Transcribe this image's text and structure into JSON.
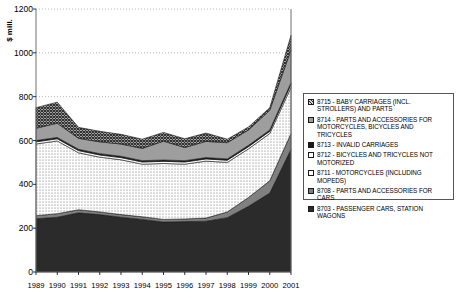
{
  "chart_data": {
    "type": "area",
    "title": "",
    "subtitle": "",
    "xlabel": "",
    "ylabel": "$ mill.",
    "ylim": [
      0,
      1200
    ],
    "yticks": [
      0,
      200,
      400,
      600,
      800,
      1000,
      1200
    ],
    "ytick_labels": [
      "0",
      "200",
      "400",
      "600",
      "800",
      "1000",
      "1200"
    ],
    "grid": "horizontal-dotted",
    "legend_position": "right",
    "stacked": true,
    "categories": [
      "1989",
      "1990",
      "1991",
      "1992",
      "1993",
      "1994",
      "1995",
      "1996",
      "1997",
      "1998",
      "1999",
      "2000",
      "2001"
    ],
    "series": [
      {
        "name": "8703 - PASSENGER CARS, STATION WAGONS",
        "code": "8703",
        "label": "8703 - PASSENGER CARS, STATION WAGONS",
        "pattern": "solid-dark",
        "color": "#2b2b2b",
        "values": [
          243,
          250,
          270,
          262,
          250,
          240,
          228,
          230,
          232,
          248,
          300,
          360,
          560
        ]
      },
      {
        "name": "8708 - PARTS AND ACCESSORIES FOR CARS",
        "code": "8708",
        "label": "8708 - PARTS AND ACCESSORIES FOR CARS",
        "pattern": "solid-gray",
        "color": "#808080",
        "values": [
          14,
          16,
          14,
          12,
          12,
          12,
          12,
          12,
          14,
          26,
          40,
          56,
          72
        ]
      },
      {
        "name": "8711 - MOTORCYCLES (INCLUDING MOPEDS)",
        "code": "8711",
        "label": "8711 - MOTORCYCLES (INCLUDING MOPEDS)",
        "pattern": "fine-dotted",
        "color": "#f2f2f2",
        "values": [
          327,
          332,
          260,
          250,
          250,
          240,
          255,
          250,
          260,
          226,
          222,
          216,
          210
        ]
      },
      {
        "name": "8712 - BICYCLES AND TRICYCLES NOT MOTORIZED",
        "code": "8712",
        "label": "8712 - BICYCLES AND TRICYCLES  NOT MOTORIZED",
        "pattern": "light-dotted",
        "color": "#fafafa",
        "values": [
          10,
          10,
          10,
          10,
          10,
          10,
          10,
          10,
          10,
          10,
          10,
          10,
          14
        ]
      },
      {
        "name": "8713 - INVALID CARRIAGES",
        "code": "8713",
        "label": "8713 - INVALID CARRIAGES",
        "pattern": "solid-black",
        "color": "#1a1a1a",
        "values": [
          6,
          6,
          6,
          6,
          6,
          6,
          6,
          6,
          6,
          6,
          6,
          6,
          8
        ]
      },
      {
        "name": "8714 - PARTS AND ACCESSORIES FOR MOTORCYCLES, BICYCLES AND TRICYCLES",
        "code": "8714",
        "label": "8714 - PARTS AND ACCESSORIES FOR MOTORCYCLES, BICYCLES AND TRICYCLES",
        "pattern": "medium-gray",
        "color": "#9e9e9e",
        "values": [
          56,
          65,
          50,
          54,
          56,
          56,
          86,
          60,
          74,
          74,
          70,
          90,
          150
        ]
      },
      {
        "name": "8715 - BABY CARRIAGES (INCL. STROLLERS) AND PARTS",
        "code": "8715",
        "label": "8715 - BABY CARRIAGES (INCL. STROLLERS) AND PARTS",
        "pattern": "crosshatch",
        "color": "#555555",
        "values": [
          94,
          96,
          50,
          48,
          44,
          42,
          40,
          40,
          38,
          16,
          14,
          12,
          66
        ]
      }
    ]
  },
  "axis": {
    "y_title": "$ mill."
  }
}
